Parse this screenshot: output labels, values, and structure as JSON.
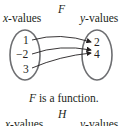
{
  "top": {
    "title": "F",
    "domain_label": "x-values",
    "range_label": "y-values",
    "domain": [
      "1",
      "−2",
      "3"
    ],
    "range": [
      "2",
      "4"
    ],
    "mappings": [
      [
        "1",
        "2"
      ],
      [
        "−2",
        "4"
      ],
      [
        "3",
        "4"
      ]
    ],
    "caption_var": "F",
    "caption_rest": " is a function."
  },
  "bottom": {
    "title": "H",
    "domain_label": "x-values",
    "range_label": "y-values"
  }
}
